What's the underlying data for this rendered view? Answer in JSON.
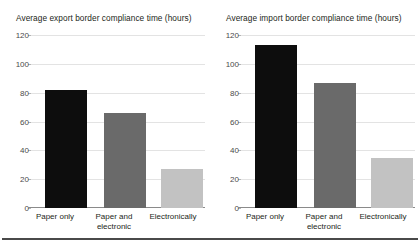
{
  "clipped_header_text": "",
  "chart_data": [
    {
      "type": "bar",
      "panel": "left",
      "title": "Average export border compliance time (hours)",
      "xlabel": "",
      "ylabel": "",
      "ylim": [
        0,
        120
      ],
      "yticks": [
        120,
        100,
        80,
        60,
        40,
        20,
        0
      ],
      "grid": true,
      "legend": "none",
      "categories": [
        "Paper only",
        "Paper and electronic",
        "Electronically"
      ],
      "category_lines": [
        [
          "Paper only"
        ],
        [
          "Paper and",
          "electronic"
        ],
        [
          "Electronically"
        ]
      ],
      "values": [
        82,
        66,
        27
      ],
      "colors": [
        "#0d0d0d",
        "#6a6a6a",
        "#c2c2c2"
      ]
    },
    {
      "type": "bar",
      "panel": "right",
      "title": "Average import border compliance time (hours)",
      "xlabel": "",
      "ylabel": "",
      "ylim": [
        0,
        120
      ],
      "yticks": [
        120,
        100,
        80,
        60,
        40,
        20,
        0
      ],
      "grid": true,
      "legend": "none",
      "categories": [
        "Paper only",
        "Paper and electronic",
        "Electronically"
      ],
      "category_lines": [
        [
          "Paper only"
        ],
        [
          "Paper and",
          "electronic"
        ],
        [
          "Electronically"
        ]
      ],
      "values": [
        113,
        87,
        35
      ],
      "colors": [
        "#0d0d0d",
        "#6a6a6a",
        "#c2c2c2"
      ]
    }
  ]
}
